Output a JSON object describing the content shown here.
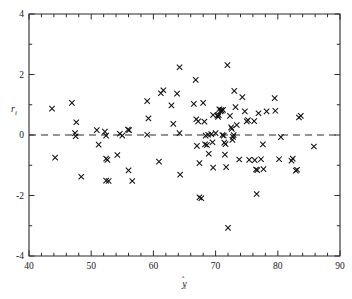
{
  "chart_data": {
    "type": "scatter",
    "title": "",
    "subtitle": "",
    "xlabel": "ŷi",
    "ylabel": "ri",
    "xlabel_base": "y",
    "xlabel_sub": "i",
    "ylabel_base": "r",
    "ylabel_sub": "i",
    "xlim": [
      40,
      90
    ],
    "ylim": [
      -4,
      4
    ],
    "x_ticks": [
      40,
      50,
      60,
      70,
      80,
      90
    ],
    "x_tick_labels": [
      "40",
      "50",
      "60",
      "70",
      "80",
      "90"
    ],
    "x_minor_step": 2,
    "y_ticks": [
      -4,
      -2,
      0,
      2,
      4
    ],
    "y_tick_labels": [
      "-4",
      "-2",
      "0",
      "2",
      "4"
    ],
    "y_minor_step": 1,
    "grid": false,
    "legend": null,
    "legend_position": "none",
    "marker_symbol": "x",
    "marker_color": "#111111",
    "frame_color": "#2b2b2b",
    "background_color": "#ffffff",
    "reference_line": {
      "orientation": "horizontal",
      "value": 0,
      "style": "dashed",
      "color": "#2b2b2b"
    },
    "annotations": [],
    "points": [
      [
        43.7,
        0.87
      ],
      [
        44.2,
        -0.75
      ],
      [
        46.9,
        1.06
      ],
      [
        47.6,
        0.42
      ],
      [
        47.4,
        0.06
      ],
      [
        47.5,
        -0.04
      ],
      [
        48.4,
        -1.38
      ],
      [
        50.9,
        0.16
      ],
      [
        51.2,
        -0.32
      ],
      [
        52.2,
        0.11
      ],
      [
        52.4,
        -0.02
      ],
      [
        52.4,
        -0.78
      ],
      [
        52.6,
        -0.82
      ],
      [
        52.4,
        -1.51
      ],
      [
        52.8,
        -1.52
      ],
      [
        54.2,
        -0.66
      ],
      [
        54.6,
        0.04
      ],
      [
        55.0,
        -0.02
      ],
      [
        55.9,
        0.18
      ],
      [
        56.1,
        0.16
      ],
      [
        56.0,
        -1.17
      ],
      [
        56.6,
        -1.52
      ],
      [
        59.0,
        1.12
      ],
      [
        59.2,
        0.55
      ],
      [
        59.0,
        0.01
      ],
      [
        60.9,
        -0.88
      ],
      [
        61.2,
        1.38
      ],
      [
        61.6,
        1.48
      ],
      [
        62.9,
        0.98
      ],
      [
        63.2,
        0.37
      ],
      [
        63.8,
        1.37
      ],
      [
        64.2,
        2.24
      ],
      [
        64.2,
        0.06
      ],
      [
        64.3,
        -1.31
      ],
      [
        66.5,
        1.03
      ],
      [
        66.8,
        1.82
      ],
      [
        66.9,
        0.52
      ],
      [
        67.2,
        0.45
      ],
      [
        67.0,
        -0.36
      ],
      [
        67.4,
        -0.93
      ],
      [
        67.4,
        -2.06
      ],
      [
        67.7,
        -2.09
      ],
      [
        68.0,
        1.06
      ],
      [
        68.2,
        0.44
      ],
      [
        68.3,
        -0.31
      ],
      [
        68.6,
        -0.33
      ],
      [
        68.4,
        -0.02
      ],
      [
        68.8,
        0.01
      ],
      [
        68.9,
        -0.62
      ],
      [
        69.3,
        0.03
      ],
      [
        69.5,
        -0.24
      ],
      [
        69.6,
        0.66
      ],
      [
        69.6,
        -1.08
      ],
      [
        70.0,
        0.06
      ],
      [
        70.3,
        0.64
      ],
      [
        70.4,
        0.6
      ],
      [
        70.5,
        0.66
      ],
      [
        70.6,
        0.85
      ],
      [
        70.8,
        0.78
      ],
      [
        70.9,
        0.82
      ],
      [
        71.0,
        0.8
      ],
      [
        71.2,
        0.83
      ],
      [
        71.1,
        0.0
      ],
      [
        71.3,
        -0.02
      ],
      [
        71.4,
        -0.25
      ],
      [
        71.6,
        -0.3
      ],
      [
        71.5,
        -0.65
      ],
      [
        71.7,
        -1.06
      ],
      [
        71.9,
        2.31
      ],
      [
        72.0,
        -3.07
      ],
      [
        72.3,
        0.63
      ],
      [
        72.5,
        0.25
      ],
      [
        72.6,
        0.2
      ],
      [
        72.7,
        -0.16
      ],
      [
        72.8,
        -0.06
      ],
      [
        72.9,
        0.0
      ],
      [
        73.0,
        1.46
      ],
      [
        73.2,
        0.92
      ],
      [
        73.4,
        0.33
      ],
      [
        73.8,
        -0.81
      ],
      [
        74.3,
        1.25
      ],
      [
        74.7,
        0.78
      ],
      [
        75.0,
        0.45
      ],
      [
        75.2,
        0.49
      ],
      [
        75.4,
        -0.82
      ],
      [
        76.2,
        0.46
      ],
      [
        76.3,
        -0.83
      ],
      [
        76.5,
        -1.14
      ],
      [
        76.7,
        -1.16
      ],
      [
        76.6,
        -1.95
      ],
      [
        76.9,
        0.72
      ],
      [
        77.3,
        -0.8
      ],
      [
        77.6,
        -0.31
      ],
      [
        77.7,
        -1.13
      ],
      [
        78.2,
        0.78
      ],
      [
        79.5,
        1.22
      ],
      [
        79.6,
        0.8
      ],
      [
        80.2,
        -0.8
      ],
      [
        80.5,
        -0.07
      ],
      [
        82.2,
        -0.85
      ],
      [
        82.4,
        -0.78
      ],
      [
        82.9,
        -1.18
      ],
      [
        83.1,
        -1.15
      ],
      [
        83.4,
        0.58
      ],
      [
        83.7,
        0.63
      ],
      [
        85.8,
        -0.38
      ]
    ]
  }
}
